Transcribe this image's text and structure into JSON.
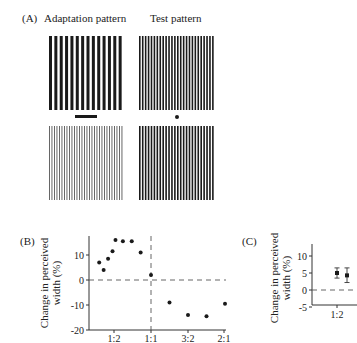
{
  "panel_a": {
    "label": "(A)",
    "adaptation_title": "Adaptation pattern",
    "test_title": "Test pattern",
    "gratings": [
      {
        "name": "adaptation-top",
        "bars": 14,
        "bar_color": "#1a1a1a",
        "bar_width": 3
      },
      {
        "name": "test-top",
        "bars": 26,
        "bar_color": "#1a1a1a",
        "bar_width": 1.6
      },
      {
        "name": "adaptation-bottom",
        "bars": 30,
        "bar_color": "#555555",
        "bar_width": 0.9
      },
      {
        "name": "test-bottom",
        "bars": 26,
        "bar_color": "#1a1a1a",
        "bar_width": 1.6
      }
    ],
    "fixation_bar": "adaptation fixation bar",
    "fixation_dot": "test fixation dot"
  },
  "panel_b": {
    "label": "(B)",
    "ylabel_line1": "Change in perceived",
    "ylabel_line2": "width (%)"
  },
  "panel_c": {
    "label": "(C)",
    "ylabel_line1": "Change in perceived",
    "ylabel_line2": "width (%)"
  },
  "chart_data": [
    {
      "type": "scatter",
      "title": "(B)",
      "xlabel": "",
      "ylabel": "Change in perceived width (%)",
      "x_tick_labels": [
        "1:2",
        "1:1",
        "3:2",
        "2:1"
      ],
      "y_ticks": [
        10,
        0,
        -10,
        -20
      ],
      "ylim": [
        -20,
        17
      ],
      "reference_lines": {
        "horizontal_y": 0,
        "vertical_x": "1:1",
        "style": "dashed"
      },
      "points": [
        {
          "x": 0.3,
          "y": 7
        },
        {
          "x": 0.36,
          "y": 4
        },
        {
          "x": 0.42,
          "y": 8.5
        },
        {
          "x": 0.48,
          "y": 11.5
        },
        {
          "x": 0.52,
          "y": 16
        },
        {
          "x": 0.62,
          "y": 15.5
        },
        {
          "x": 0.74,
          "y": 15.5
        },
        {
          "x": 0.86,
          "y": 11
        },
        {
          "x": 1.0,
          "y": 2
        },
        {
          "x": 1.25,
          "y": -9
        },
        {
          "x": 1.5,
          "y": -14
        },
        {
          "x": 1.75,
          "y": -14.5
        },
        {
          "x": 2.0,
          "y": -9.5
        }
      ]
    },
    {
      "type": "scatter",
      "title": "(C)",
      "xlabel": "",
      "ylabel": "Change in perceived width (%)",
      "x_tick_labels": [
        "1:2"
      ],
      "y_ticks": [
        10,
        5,
        0,
        -5
      ],
      "ylim": [
        -5,
        12
      ],
      "reference_lines": {
        "horizontal_y": 0,
        "style": "dashed"
      },
      "points": [
        {
          "x": "1:2",
          "y": 5,
          "err_low": 3.5,
          "err_high": 6.5
        },
        {
          "x": "1:2 (b)",
          "y": 4.3,
          "err_low": 2.2,
          "err_high": 6.5
        }
      ]
    }
  ]
}
